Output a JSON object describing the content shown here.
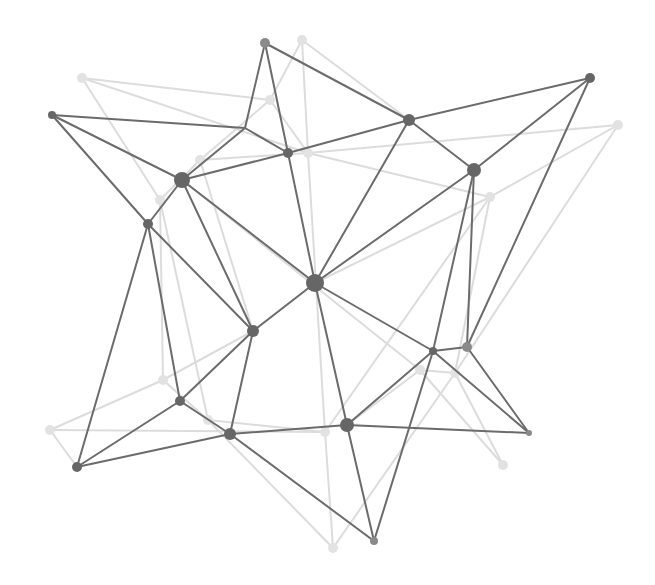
{
  "diagram": {
    "title": "",
    "type": "network-mesh",
    "width": 655,
    "height": 585,
    "colors": {
      "background": "#ffffff",
      "dark_edge": "#6b6b6b",
      "dark_node": "#666666",
      "mid_node": "#8a8a8a",
      "light_edge": "#dcdcdc",
      "light_node": "#e2e2e2"
    },
    "dark_nodes": [
      {
        "id": "A",
        "x": 52,
        "y": 115,
        "r": 4
      },
      {
        "id": "B",
        "x": 265,
        "y": 43,
        "r": 5,
        "tone": "mid"
      },
      {
        "id": "C",
        "x": 245,
        "y": 128,
        "r": 0
      },
      {
        "id": "D",
        "x": 182,
        "y": 180,
        "r": 8
      },
      {
        "id": "E",
        "x": 288,
        "y": 153,
        "r": 5
      },
      {
        "id": "F",
        "x": 409,
        "y": 120,
        "r": 6
      },
      {
        "id": "F2",
        "x": 590,
        "y": 78,
        "r": 5
      },
      {
        "id": "G",
        "x": 474,
        "y": 170,
        "r": 7
      },
      {
        "id": "H",
        "x": 148,
        "y": 224,
        "r": 5
      },
      {
        "id": "I",
        "x": 315,
        "y": 283,
        "r": 9
      },
      {
        "id": "J",
        "x": 253,
        "y": 331,
        "r": 6
      },
      {
        "id": "K",
        "x": 433,
        "y": 351,
        "r": 4
      },
      {
        "id": "L",
        "x": 467,
        "y": 347,
        "r": 5,
        "tone": "mid"
      },
      {
        "id": "M",
        "x": 180,
        "y": 401,
        "r": 5
      },
      {
        "id": "N",
        "x": 230,
        "y": 434,
        "r": 6
      },
      {
        "id": "O",
        "x": 347,
        "y": 425,
        "r": 7
      },
      {
        "id": "P",
        "x": 77,
        "y": 467,
        "r": 5
      },
      {
        "id": "Q",
        "x": 529,
        "y": 433,
        "r": 3,
        "tone": "mid"
      },
      {
        "id": "R",
        "x": 374,
        "y": 541,
        "r": 4,
        "tone": "mid"
      }
    ],
    "dark_edges": [
      [
        "A",
        "C"
      ],
      [
        "A",
        "D"
      ],
      [
        "A",
        "H"
      ],
      [
        "B",
        "C"
      ],
      [
        "B",
        "E"
      ],
      [
        "B",
        "F"
      ],
      [
        "C",
        "D"
      ],
      [
        "C",
        "E"
      ],
      [
        "D",
        "E"
      ],
      [
        "D",
        "H"
      ],
      [
        "D",
        "I"
      ],
      [
        "D",
        "J"
      ],
      [
        "E",
        "F"
      ],
      [
        "E",
        "I"
      ],
      [
        "F",
        "F2"
      ],
      [
        "F",
        "G"
      ],
      [
        "F",
        "I"
      ],
      [
        "F2",
        "G"
      ],
      [
        "F2",
        "L"
      ],
      [
        "G",
        "I"
      ],
      [
        "G",
        "K"
      ],
      [
        "G",
        "L"
      ],
      [
        "H",
        "J"
      ],
      [
        "H",
        "M"
      ],
      [
        "H",
        "P"
      ],
      [
        "I",
        "J"
      ],
      [
        "I",
        "O"
      ],
      [
        "I",
        "K"
      ],
      [
        "J",
        "M"
      ],
      [
        "J",
        "N"
      ],
      [
        "K",
        "L"
      ],
      [
        "K",
        "O"
      ],
      [
        "K",
        "Q"
      ],
      [
        "K",
        "R"
      ],
      [
        "L",
        "Q"
      ],
      [
        "M",
        "N"
      ],
      [
        "M",
        "P"
      ],
      [
        "N",
        "O"
      ],
      [
        "N",
        "P"
      ],
      [
        "N",
        "R"
      ],
      [
        "O",
        "Q"
      ],
      [
        "O",
        "R"
      ]
    ],
    "light_nodes": [
      {
        "id": "a",
        "x": 82,
        "y": 78
      },
      {
        "id": "b",
        "x": 302,
        "y": 40
      },
      {
        "id": "c",
        "x": 200,
        "y": 160
      },
      {
        "id": "d",
        "x": 308,
        "y": 153
      },
      {
        "id": "e",
        "x": 160,
        "y": 200
      },
      {
        "id": "f",
        "x": 618,
        "y": 125
      },
      {
        "id": "g",
        "x": 490,
        "y": 197
      },
      {
        "id": "h",
        "x": 163,
        "y": 380
      },
      {
        "id": "i",
        "x": 50,
        "y": 430
      },
      {
        "id": "j",
        "x": 208,
        "y": 420
      },
      {
        "id": "k",
        "x": 325,
        "y": 432
      },
      {
        "id": "l",
        "x": 420,
        "y": 370
      },
      {
        "id": "m",
        "x": 455,
        "y": 373
      },
      {
        "id": "n",
        "x": 503,
        "y": 465
      },
      {
        "id": "o",
        "x": 333,
        "y": 548
      },
      {
        "id": "p",
        "x": 270,
        "y": 100
      }
    ],
    "light_edges": [
      [
        "a",
        "p"
      ],
      [
        "a",
        "d"
      ],
      [
        "a",
        "e"
      ],
      [
        "b",
        "p"
      ],
      [
        "b",
        "d"
      ],
      [
        "b",
        "F"
      ],
      [
        "p",
        "c"
      ],
      [
        "p",
        "d"
      ],
      [
        "c",
        "d"
      ],
      [
        "c",
        "e"
      ],
      [
        "c",
        "J"
      ],
      [
        "d",
        "f"
      ],
      [
        "d",
        "k"
      ],
      [
        "d",
        "g"
      ],
      [
        "e",
        "h"
      ],
      [
        "e",
        "j"
      ],
      [
        "f",
        "g"
      ],
      [
        "f",
        "m"
      ],
      [
        "g",
        "I"
      ],
      [
        "g",
        "m"
      ],
      [
        "h",
        "i"
      ],
      [
        "h",
        "J"
      ],
      [
        "h",
        "j"
      ],
      [
        "i",
        "P"
      ],
      [
        "i",
        "k"
      ],
      [
        "j",
        "k"
      ],
      [
        "j",
        "o"
      ],
      [
        "k",
        "o"
      ],
      [
        "k",
        "g"
      ],
      [
        "l",
        "m"
      ],
      [
        "l",
        "O"
      ],
      [
        "l",
        "n"
      ],
      [
        "m",
        "n"
      ],
      [
        "m",
        "o"
      ],
      [
        "D",
        "l"
      ]
    ]
  }
}
